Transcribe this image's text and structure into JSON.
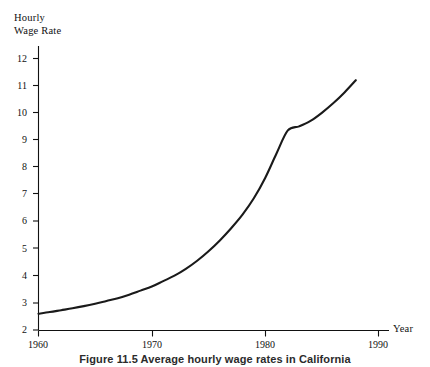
{
  "chart_data": {
    "type": "line",
    "title": "",
    "caption": "Figure 11.5   Average hourly wage rates in California",
    "xlabel": "Year",
    "ylabel": "Hourly Wage Rate",
    "ylabel_line1": "Hourly",
    "ylabel_line2": "Wage Rate",
    "xlim": [
      1960,
      1990
    ],
    "ylim": [
      2,
      12
    ],
    "grid": false,
    "legend": "none",
    "xticks": [
      1960,
      1970,
      1980,
      1990
    ],
    "xtick_labels": [
      "1960",
      "1970",
      "1980",
      "1990"
    ],
    "yticks": [
      2,
      3,
      4,
      5,
      6,
      7,
      8,
      9,
      10,
      11,
      12
    ],
    "ytick_labels": [
      "2",
      "3",
      "4",
      "5",
      "6",
      "7",
      "8",
      "9",
      "10",
      "11",
      "12"
    ],
    "series": [
      {
        "name": "Average hourly wage rate",
        "color": "#1a1a1a",
        "x": [
          1960,
          1961,
          1962,
          1963,
          1964,
          1965,
          1966,
          1967,
          1968,
          1969,
          1970,
          1971,
          1972,
          1973,
          1974,
          1975,
          1976,
          1977,
          1978,
          1979,
          1980,
          1981,
          1982,
          1983,
          1984,
          1985,
          1986,
          1987,
          1988
        ],
        "values": [
          2.6,
          2.66,
          2.73,
          2.8,
          2.88,
          2.97,
          3.07,
          3.17,
          3.3,
          3.45,
          3.6,
          3.8,
          4.0,
          4.25,
          4.55,
          4.9,
          5.3,
          5.75,
          6.25,
          6.85,
          7.6,
          8.5,
          9.35,
          9.5,
          9.7,
          10.0,
          10.35,
          10.75,
          11.2
        ]
      }
    ]
  }
}
